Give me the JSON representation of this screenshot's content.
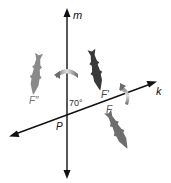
{
  "diagram": {
    "type": "geometry-reflection",
    "lines": {
      "m": {
        "label": "m",
        "orientation": "vertical"
      },
      "k": {
        "label": "k",
        "orientation": "slanted"
      }
    },
    "intersection_label": "P",
    "angle_label": "70°",
    "figures": {
      "original": {
        "label": "F",
        "color": "#6e6e6e"
      },
      "first_image": {
        "label": "F′",
        "color": "#3a3a3a"
      },
      "second_image": {
        "label": "F″",
        "color": "#8a8a8a"
      }
    },
    "colors": {
      "line": "#111111",
      "arrow_gradient_light": "#d8d8d8",
      "arrow_gradient_dark": "#6a6a6a"
    }
  }
}
